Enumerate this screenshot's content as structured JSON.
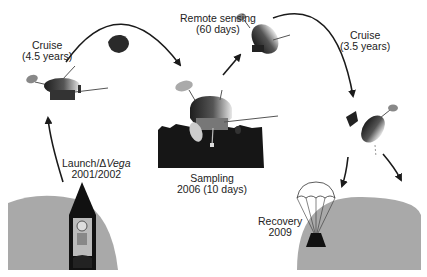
{
  "diagram": {
    "type": "mission-timeline",
    "stages": [
      {
        "id": "launch",
        "title": "Launch/ΔVega",
        "title_prefix": "Launch/Δ",
        "title_italic": "Vega",
        "subtitle": "2001/2002"
      },
      {
        "id": "cruise1",
        "title": "Cruise",
        "subtitle": "(4.5 years)"
      },
      {
        "id": "remote",
        "title": "Remote sensing",
        "subtitle": "(60 days)"
      },
      {
        "id": "sampling",
        "title": "Sampling",
        "subtitle": "2006 (10 days)"
      },
      {
        "id": "cruise2",
        "title": "Cruise",
        "subtitle": "(3.5 years)"
      },
      {
        "id": "recovery",
        "title": "Recovery",
        "subtitle": "2009"
      }
    ],
    "colors": {
      "planet": "#a9a9a9",
      "arrow": "#1a1a1a",
      "surface": "#161616",
      "craft_dark": "#222222",
      "craft_light": "#d8d8d8"
    },
    "icons": [
      "earth-launch-icon",
      "rocket-icon",
      "spacecraft-icon",
      "asteroid-icon",
      "lander-icon",
      "capsule-icon",
      "parachute-icon",
      "earth-recovery-icon"
    ]
  }
}
